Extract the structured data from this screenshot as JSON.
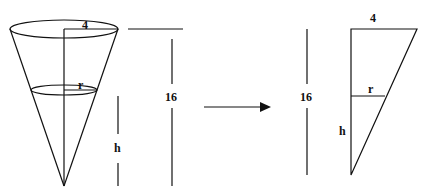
{
  "diagram": {
    "cone": {
      "top_radius_label": "4",
      "water_radius_label": "r",
      "height_label": "16",
      "water_height_label": "h"
    },
    "arrow": {
      "direction": "right"
    },
    "triangle": {
      "top_label": "4",
      "height_label": "16",
      "water_radius_label": "r",
      "water_height_label": "h"
    },
    "colors": {
      "stroke": "#111111",
      "background": "#ffffff"
    }
  }
}
